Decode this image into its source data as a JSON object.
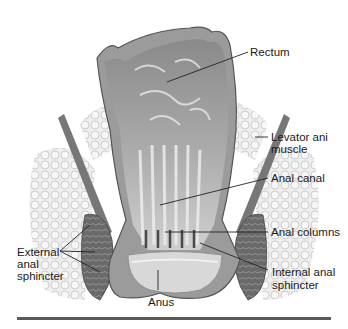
{
  "figure": {
    "labels": {
      "rectum": "Rectum",
      "levator_line1": "Levator ani",
      "levator_line2": "muscle",
      "anal_canal": "Anal canal",
      "anal_columns": "Anal columns",
      "internal_line1": "Internal anal",
      "internal_line2": "sphincter",
      "external_line1": "External",
      "external_line2": "anal",
      "external_line3": "sphincter",
      "anus": "Anus"
    },
    "colors": {
      "mucosa_dark": "#6b6b6b",
      "mucosa_light": "#c8c8c8",
      "fat": "#e6e6e6",
      "muscle": "#5e5e5e",
      "leader": "#222222",
      "rule": "#5a5a5a"
    }
  }
}
